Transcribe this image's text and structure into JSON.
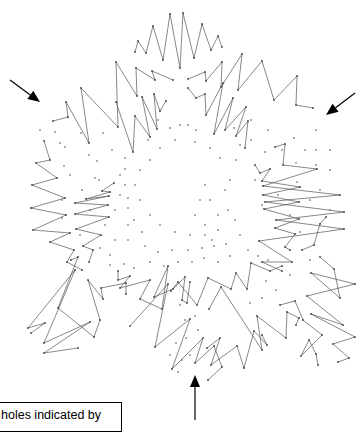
{
  "figure": {
    "stroke_color": "#555555",
    "dot_color": "#444444",
    "arrow_color": "#000000",
    "zigzags": [
      [
        [
          135,
          52
        ],
        [
          138,
          41
        ],
        [
          146,
          53
        ],
        [
          153,
          26
        ],
        [
          163,
          60
        ],
        [
          170,
          14
        ],
        [
          180,
          68
        ],
        [
          183,
          13
        ],
        [
          194,
          58
        ],
        [
          202,
          24
        ],
        [
          211,
          50
        ],
        [
          218,
          36
        ],
        [
          222,
          47
        ]
      ],
      [
        [
          53,
          121
        ],
        [
          68,
          117
        ],
        [
          66,
          102
        ],
        [
          89,
          143
        ],
        [
          81,
          88
        ],
        [
          118,
          127
        ],
        [
          116,
          62
        ],
        [
          137,
          96
        ],
        [
          136,
          68
        ],
        [
          155,
          80
        ],
        [
          152,
          71
        ],
        [
          173,
          80
        ]
      ],
      [
        [
          116,
          102
        ],
        [
          133,
          152
        ],
        [
          135,
          116
        ],
        [
          150,
          137
        ],
        [
          142,
          97
        ],
        [
          157,
          129
        ],
        [
          154,
          94
        ],
        [
          160,
          111
        ],
        [
          166,
          101
        ]
      ],
      [
        [
          188,
          79
        ],
        [
          205,
          72
        ],
        [
          206,
          81
        ],
        [
          222,
          62
        ],
        [
          221,
          87
        ],
        [
          242,
          54
        ],
        [
          238,
          90
        ],
        [
          262,
          61
        ],
        [
          274,
          100
        ],
        [
          297,
          76
        ],
        [
          296,
          105
        ],
        [
          313,
          108
        ]
      ],
      [
        [
          188,
          88
        ],
        [
          196,
          98
        ],
        [
          205,
          94
        ],
        [
          206,
          115
        ],
        [
          223,
          83
        ],
        [
          214,
          134
        ],
        [
          233,
          98
        ],
        [
          225,
          130
        ],
        [
          246,
          107
        ],
        [
          236,
          136
        ],
        [
          248,
          121
        ],
        [
          245,
          148
        ]
      ],
      [
        [
          44,
          141
        ],
        [
          50,
          160
        ],
        [
          36,
          163
        ],
        [
          57,
          178
        ],
        [
          32,
          185
        ],
        [
          65,
          198
        ],
        [
          31,
          208
        ],
        [
          66,
          215
        ],
        [
          33,
          230
        ],
        [
          70,
          233
        ],
        [
          50,
          242
        ],
        [
          74,
          250
        ],
        [
          67,
          262
        ],
        [
          82,
          270
        ]
      ],
      [
        [
          114,
          183
        ],
        [
          102,
          191
        ],
        [
          110,
          192
        ],
        [
          86,
          199
        ],
        [
          109,
          196
        ],
        [
          75,
          203
        ],
        [
          108,
          205
        ],
        [
          75,
          214
        ],
        [
          109,
          217
        ],
        [
          76,
          229
        ],
        [
          101,
          235
        ],
        [
          83,
          246
        ],
        [
          93,
          250
        ],
        [
          89,
          262
        ]
      ],
      [
        [
          275,
          147
        ],
        [
          285,
          144
        ],
        [
          283,
          165
        ],
        [
          317,
          169
        ],
        [
          263,
          186
        ],
        [
          340,
          195
        ],
        [
          265,
          202
        ],
        [
          344,
          212
        ],
        [
          276,
          220
        ],
        [
          344,
          229
        ],
        [
          259,
          241
        ],
        [
          292,
          262
        ],
        [
          262,
          262
        ],
        [
          282,
          271
        ]
      ],
      [
        [
          255,
          165
        ],
        [
          260,
          173
        ],
        [
          270,
          169
        ],
        [
          262,
          181
        ],
        [
          300,
          187
        ],
        [
          263,
          195
        ],
        [
          299,
          202
        ],
        [
          264,
          209
        ],
        [
          299,
          219
        ],
        [
          275,
          228
        ],
        [
          295,
          234
        ],
        [
          285,
          247
        ],
        [
          290,
          250
        ]
      ],
      [
        [
          31,
          333
        ],
        [
          45,
          323
        ],
        [
          28,
          328
        ],
        [
          75,
          270
        ],
        [
          44,
          343
        ],
        [
          90,
          322
        ],
        [
          44,
          353
        ],
        [
          78,
          348
        ]
      ],
      [
        [
          71,
          260
        ],
        [
          78,
          257
        ],
        [
          58,
          308
        ],
        [
          94,
          337
        ],
        [
          100,
          320
        ],
        [
          88,
          280
        ],
        [
          103,
          299
        ],
        [
          101,
          288
        ],
        [
          126,
          283
        ],
        [
          126,
          294
        ]
      ],
      [
        [
          118,
          271
        ],
        [
          118,
          280
        ],
        [
          130,
          276
        ],
        [
          120,
          288
        ],
        [
          150,
          280
        ],
        [
          140,
          299
        ],
        [
          162,
          309
        ],
        [
          168,
          266
        ],
        [
          154,
          297
        ],
        [
          173,
          289
        ],
        [
          185,
          277
        ],
        [
          182,
          300
        ],
        [
          187,
          303
        ],
        [
          190,
          282
        ]
      ],
      [
        [
          130,
          326
        ],
        [
          168,
          284
        ],
        [
          155,
          347
        ],
        [
          190,
          319
        ],
        [
          172,
          369
        ],
        [
          203,
          338
        ],
        [
          195,
          363
        ],
        [
          214,
          346
        ],
        [
          222,
          367
        ],
        [
          208,
          380
        ]
      ],
      [
        [
          171,
          291
        ],
        [
          178,
          282
        ],
        [
          197,
          305
        ],
        [
          208,
          278
        ],
        [
          231,
          289
        ],
        [
          236,
          273
        ],
        [
          247,
          289
        ],
        [
          251,
          263
        ],
        [
          270,
          271
        ],
        [
          282,
          266
        ]
      ],
      [
        [
          209,
          309
        ],
        [
          221,
          287
        ],
        [
          262,
          350
        ],
        [
          257,
          316
        ],
        [
          286,
          338
        ],
        [
          287,
          312
        ],
        [
          299,
          318
        ],
        [
          296,
          325
        ]
      ],
      [
        [
          207,
          348
        ],
        [
          220,
          338
        ],
        [
          211,
          365
        ],
        [
          237,
          346
        ],
        [
          244,
          368
        ],
        [
          254,
          331
        ],
        [
          267,
          345
        ],
        [
          262,
          335
        ]
      ],
      [
        [
          320,
          257
        ],
        [
          334,
          269
        ],
        [
          340,
          298
        ],
        [
          311,
          273
        ],
        [
          355,
          284
        ],
        [
          307,
          296
        ],
        [
          343,
          325
        ],
        [
          311,
          314
        ],
        [
          355,
          337
        ],
        [
          333,
          344
        ],
        [
          349,
          358
        ],
        [
          338,
          362
        ]
      ],
      [
        [
          280,
          305
        ],
        [
          295,
          301
        ],
        [
          303,
          320
        ],
        [
          322,
          335
        ],
        [
          301,
          356
        ],
        [
          309,
          340
        ],
        [
          316,
          354
        ],
        [
          318,
          365
        ]
      ],
      [
        [
          326,
          217
        ],
        [
          320,
          224
        ],
        [
          314,
          245
        ],
        [
          302,
          250
        ]
      ]
    ],
    "dots": [
      [
        60,
        143
      ],
      [
        81,
        133
      ],
      [
        103,
        133
      ],
      [
        64,
        166
      ],
      [
        89,
        155
      ],
      [
        112,
        150
      ],
      [
        70,
        175
      ],
      [
        95,
        178
      ],
      [
        120,
        175
      ],
      [
        82,
        190
      ],
      [
        99,
        180
      ],
      [
        120,
        195
      ],
      [
        97,
        161
      ],
      [
        65,
        147
      ],
      [
        40,
        130
      ],
      [
        55,
        132
      ],
      [
        62,
        200
      ],
      [
        125,
        158
      ],
      [
        125,
        169
      ],
      [
        125,
        185
      ],
      [
        128,
        198
      ],
      [
        128,
        208
      ],
      [
        128,
        225
      ],
      [
        128,
        240
      ],
      [
        234,
        128
      ],
      [
        251,
        120
      ],
      [
        268,
        130
      ],
      [
        251,
        140
      ],
      [
        265,
        152
      ],
      [
        282,
        150
      ],
      [
        296,
        163
      ],
      [
        294,
        138
      ],
      [
        305,
        150
      ],
      [
        316,
        130
      ],
      [
        316,
        150
      ],
      [
        316,
        165
      ],
      [
        330,
        150
      ],
      [
        330,
        170
      ],
      [
        240,
        145
      ],
      [
        236,
        160
      ],
      [
        230,
        180
      ],
      [
        225,
        190
      ],
      [
        228,
        210
      ],
      [
        235,
        220
      ],
      [
        240,
        235
      ],
      [
        248,
        250
      ],
      [
        258,
        256
      ],
      [
        268,
        260
      ],
      [
        180,
        125
      ],
      [
        188,
        125
      ],
      [
        196,
        130
      ],
      [
        170,
        128
      ],
      [
        158,
        120
      ],
      [
        148,
        140
      ],
      [
        160,
        148
      ],
      [
        175,
        140
      ],
      [
        195,
        142
      ],
      [
        210,
        148
      ],
      [
        220,
        158
      ],
      [
        110,
        265
      ],
      [
        124,
        264
      ],
      [
        134,
        268
      ],
      [
        150,
        262
      ],
      [
        164,
        266
      ],
      [
        178,
        262
      ],
      [
        192,
        262
      ],
      [
        204,
        258
      ],
      [
        218,
        262
      ],
      [
        230,
        256
      ],
      [
        145,
        246
      ],
      [
        158,
        252
      ],
      [
        172,
        250
      ],
      [
        188,
        250
      ],
      [
        202,
        248
      ],
      [
        214,
        246
      ],
      [
        226,
        244
      ],
      [
        142,
        232
      ],
      [
        134,
        220
      ],
      [
        180,
        305
      ],
      [
        185,
        320
      ],
      [
        186,
        338
      ],
      [
        195,
        316
      ],
      [
        198,
        330
      ],
      [
        190,
        355
      ],
      [
        182,
        360
      ],
      [
        176,
        343
      ],
      [
        170,
        355
      ],
      [
        178,
        372
      ],
      [
        255,
        180
      ],
      [
        262,
        205
      ],
      [
        278,
        195
      ],
      [
        290,
        215
      ],
      [
        297,
        182
      ],
      [
        310,
        200
      ],
      [
        320,
        190
      ],
      [
        330,
        210
      ],
      [
        300,
        232
      ],
      [
        310,
        260
      ],
      [
        290,
        275
      ],
      [
        266,
        281
      ],
      [
        276,
        290
      ],
      [
        262,
        298
      ],
      [
        250,
        303
      ],
      [
        62,
        218
      ],
      [
        80,
        235
      ],
      [
        100,
        248
      ],
      [
        110,
        255
      ],
      [
        115,
        240
      ],
      [
        105,
        225
      ],
      [
        90,
        210
      ],
      [
        115,
        210
      ],
      [
        205,
        185
      ],
      [
        210,
        200
      ],
      [
        218,
        215
      ],
      [
        218,
        230
      ],
      [
        212,
        240
      ],
      [
        205,
        225
      ],
      [
        195,
        215
      ],
      [
        200,
        200
      ],
      [
        150,
        160
      ],
      [
        140,
        170
      ],
      [
        135,
        185
      ],
      [
        140,
        200
      ],
      [
        150,
        215
      ],
      [
        160,
        225
      ],
      [
        175,
        232
      ],
      [
        190,
        235
      ],
      [
        205,
        235
      ]
    ],
    "arrows": [
      {
        "name": "arrow-upper-left",
        "x1": 10,
        "y1": 80,
        "x2": 40,
        "y2": 102
      },
      {
        "name": "arrow-upper-right",
        "x1": 355,
        "y1": 93,
        "x2": 326,
        "y2": 115
      },
      {
        "name": "arrow-bottom",
        "x1": 195,
        "y1": 420,
        "x2": 195,
        "y2": 375
      }
    ]
  },
  "caption": {
    "text": "holes indicated by"
  }
}
